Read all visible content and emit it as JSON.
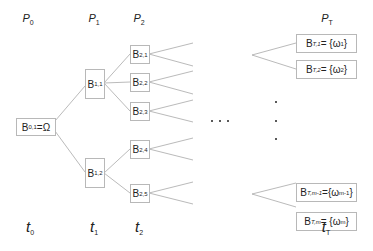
{
  "diagram": {
    "type": "scenario-tree",
    "partitions": [
      {
        "base": "P",
        "sub": "0",
        "x": 28
      },
      {
        "base": "P",
        "sub": "1",
        "x": 94
      },
      {
        "base": "P",
        "sub": "2",
        "x": 139
      },
      {
        "base": "P",
        "sub": "T",
        "x": 327
      }
    ],
    "times": [
      {
        "base": "t",
        "sub": "0",
        "x": 30
      },
      {
        "base": "t",
        "sub": "1",
        "x": 94
      },
      {
        "base": "t",
        "sub": "2",
        "x": 139
      },
      {
        "base": "t",
        "sub": "T",
        "x": 326
      }
    ],
    "nodes": {
      "root": {
        "base": "B",
        "sub": "0,1",
        "suffix": "=Ω"
      },
      "b11": {
        "base": "B",
        "sub": "1,1",
        "suffix": ""
      },
      "b12": {
        "base": "B",
        "sub": "1,2",
        "suffix": ""
      },
      "b21": {
        "base": "B",
        "sub": "2,1",
        "suffix": ""
      },
      "b22": {
        "base": "B",
        "sub": "2,2",
        "suffix": ""
      },
      "b23": {
        "base": "B",
        "sub": "2,3",
        "suffix": ""
      },
      "b24": {
        "base": "B",
        "sub": "2,4",
        "suffix": ""
      },
      "b25": {
        "base": "B",
        "sub": "2,5",
        "suffix": ""
      },
      "bT1": {
        "base": "B",
        "sub": "T,1",
        "suffix": "= {ω",
        "suffix_sub": "1",
        "suffix_end": "}"
      },
      "bT2": {
        "base": "B",
        "sub": "T,2",
        "suffix": "= {ω",
        "suffix_sub": "2",
        "suffix_end": "}"
      },
      "bTm1": {
        "base": "B",
        "sub": "T,m-1",
        "suffix": "={ω",
        "suffix_sub": "m-1",
        "suffix_end": "}"
      },
      "bTm": {
        "base": "B",
        "sub": "T,m",
        "suffix": "= {ω",
        "suffix_sub": "m",
        "suffix_end": "}"
      }
    },
    "ellipsis_horizontal": "• • •",
    "ellipsis_vertical": "⋮"
  }
}
